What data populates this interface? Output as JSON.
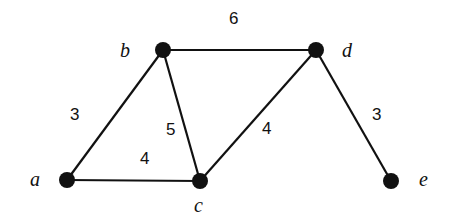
{
  "diagram": {
    "type": "weighted-undirected-graph",
    "nodes": [
      {
        "id": "a",
        "label": "a",
        "x": 67,
        "y": 180,
        "lx": 30,
        "ly": 186
      },
      {
        "id": "b",
        "label": "b",
        "x": 163,
        "y": 50,
        "lx": 120,
        "ly": 57
      },
      {
        "id": "c",
        "label": "c",
        "x": 200,
        "y": 181,
        "lx": 194,
        "ly": 212
      },
      {
        "id": "d",
        "label": "d",
        "x": 316,
        "y": 50,
        "lx": 342,
        "ly": 57
      },
      {
        "id": "e",
        "label": "e",
        "x": 391,
        "y": 181,
        "lx": 419,
        "ly": 186
      }
    ],
    "edges": [
      {
        "from": "b",
        "to": "d",
        "weight": "6",
        "wx": 229,
        "wy": 24
      },
      {
        "from": "a",
        "to": "b",
        "weight": "3",
        "wx": 70,
        "wy": 120
      },
      {
        "from": "b",
        "to": "c",
        "weight": "5",
        "wx": 166,
        "wy": 135
      },
      {
        "from": "c",
        "to": "d",
        "weight": "4",
        "wx": 262,
        "wy": 134
      },
      {
        "from": "a",
        "to": "c",
        "weight": "4",
        "wx": 140,
        "wy": 164
      },
      {
        "from": "d",
        "to": "e",
        "weight": "3",
        "wx": 372,
        "wy": 120
      }
    ]
  }
}
